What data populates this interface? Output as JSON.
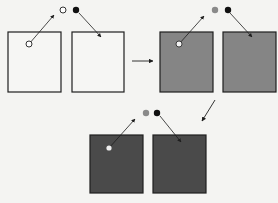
{
  "colors": {
    "background": "#f4f4f2",
    "stroke": "#1e1e1e",
    "box_white": "#f6f6f4",
    "box_mid": "#858585",
    "box_dark": "#4a4a4a",
    "circle_open": "#ffffff",
    "circle_gray": "#8a8a8a",
    "circle_black": "#111111"
  },
  "stages": [
    {
      "name": "stage-1-white",
      "fill": "box_white",
      "inner_dot": "#ffffff",
      "top_left_circle": "circle_open"
    },
    {
      "name": "stage-2-gray",
      "fill": "box_mid",
      "inner_dot": "#f2f2f2",
      "top_left_circle": "circle_gray"
    },
    {
      "name": "stage-3-dark",
      "fill": "box_dark",
      "inner_dot": "#eeeeee",
      "top_left_circle": "circle_gray"
    }
  ]
}
